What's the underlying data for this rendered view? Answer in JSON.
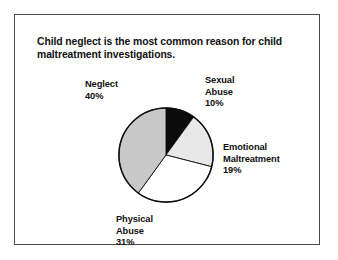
{
  "figure": {
    "title": "Child neglect is the most common reason for child maltreatment investigations.",
    "border_color": "#4a4a4a",
    "background": "#ffffff"
  },
  "chart_data": {
    "type": "pie",
    "title": "Child neglect is the most common reason for child maltreatment investigations.",
    "xlabel": "",
    "ylabel": "",
    "units": "percent",
    "start_angle_deg": 0,
    "direction": "clockwise",
    "legend": "none",
    "grid": false,
    "categories": [
      "Sexual Abuse",
      "Emotional Maltreatment",
      "Physical Abuse",
      "Neglect"
    ],
    "values": [
      10,
      19,
      31,
      40
    ],
    "colors": [
      "#0b0b0b",
      "#e8e8e8",
      "#ffffff",
      "#c8c8c8"
    ],
    "slices": [
      {
        "name": "Sexual Abuse",
        "value": 10,
        "label": "Sexual\nAbuse",
        "pct_text": "10%",
        "color": "#0b0b0b"
      },
      {
        "name": "Emotional Maltreatment",
        "value": 19,
        "label": "Emotional\nMaltreatment",
        "pct_text": "19%",
        "color": "#e8e8e8"
      },
      {
        "name": "Physical Abuse",
        "value": 31,
        "label": "Physical\nAbuse",
        "pct_text": "31%",
        "color": "#ffffff"
      },
      {
        "name": "Neglect",
        "value": 40,
        "label": "Neglect",
        "pct_text": "40%",
        "color": "#c8c8c8"
      }
    ]
  },
  "labels": {
    "neglect": {
      "line1": "Neglect",
      "pct": "40%"
    },
    "sexual": {
      "line1": "Sexual",
      "line2": "Abuse",
      "pct": "10%"
    },
    "emotional": {
      "line1": "Emotional",
      "line2": "Maltreatment",
      "pct": "19%"
    },
    "physical": {
      "line1": "Physical",
      "line2": "Abuse",
      "pct": "31%"
    }
  }
}
